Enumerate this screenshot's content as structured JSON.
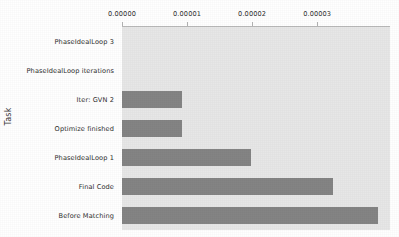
{
  "chart_data": {
    "type": "bar",
    "orientation": "horizontal",
    "title": "",
    "xlabel": "",
    "ylabel": "Task",
    "categories": [
      "PhaseIdealLoop 3",
      "PhaseIdealLoop iterations",
      "Iter: GVN 2",
      "Optimize finished",
      "PhaseIdealLoop 1",
      "Final Code",
      "Before Matching"
    ],
    "values": [
      0.0,
      0.0,
      9.2e-06,
      9.2e-06,
      1.98e-05,
      3.25e-05,
      3.93e-05
    ],
    "xticks": [
      0.0,
      1e-05,
      2e-05,
      3e-05
    ],
    "xtick_labels": [
      "0.00000",
      "0.00001",
      "0.00002",
      "0.00003"
    ],
    "xlim": [
      0.0,
      4.12e-05
    ],
    "xaxis_position": "top",
    "grid": false,
    "legend": null,
    "bar_color": "#848484",
    "plot_background": "#e7e7e7",
    "figure_background": "#ffffff",
    "tick_label_color": "#2e2e2e"
  }
}
